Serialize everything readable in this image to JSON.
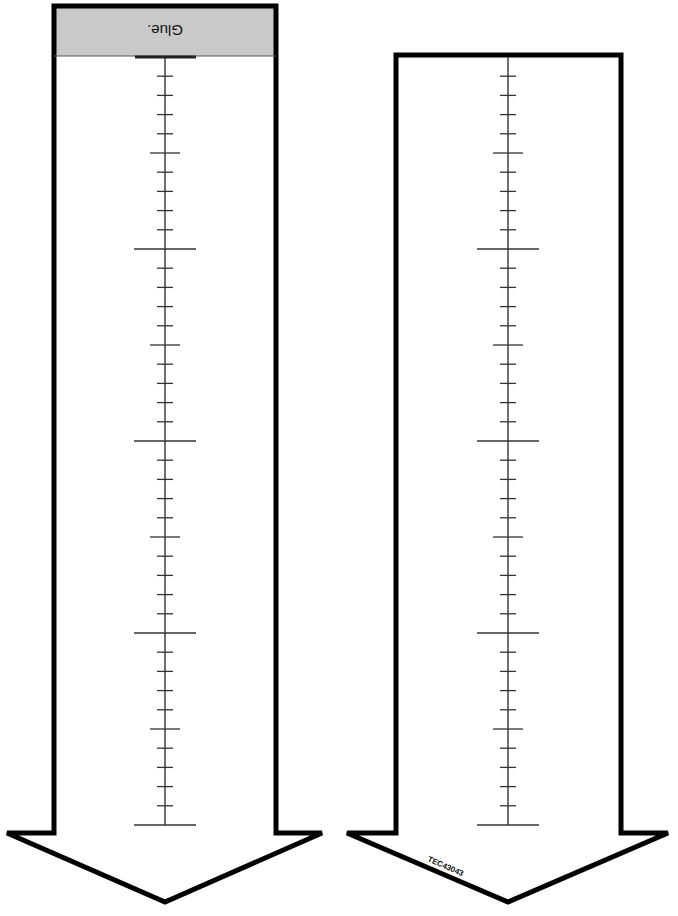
{
  "diagram": {
    "type": "cut-out ruler arrows",
    "colors": {
      "outline": "#000000",
      "glue_band": "#c9c9c9",
      "ruler": "#222222",
      "background": "#ffffff"
    },
    "left_arrow": {
      "glue_label": "Glue.",
      "glue_label_orientation": "upside-down",
      "ruler": {
        "top_y": 57,
        "bottom_y": 825,
        "minor_ticks_per_major": 10,
        "major_tick_count": 4
      }
    },
    "right_arrow": {
      "code_label": "TEC43043",
      "ruler": {
        "top_y": 57,
        "bottom_y": 825,
        "minor_ticks_per_major": 10,
        "major_tick_count": 4
      }
    }
  }
}
